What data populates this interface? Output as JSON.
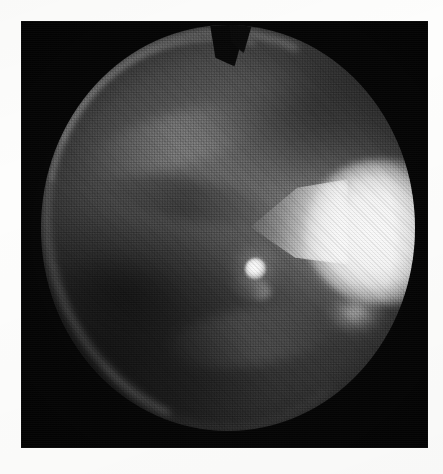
{
  "figure": {
    "kind": "grayscale-photograph",
    "modality": "endoscopic-fundus-photograph",
    "caption": "",
    "alt_text": "Grayscale circular endoscopic photograph on a black plate",
    "page_background": "#fdfdfc",
    "plate": {
      "background_color": "#050505",
      "left": 21,
      "top": 21,
      "width": 407,
      "height": 427
    },
    "field_of_view": {
      "shape": "circle",
      "center_x": 228,
      "center_y": 228,
      "radius_x": 187,
      "radius_y": 203,
      "mean_tone": "#3a3a3a"
    },
    "regions": [
      {
        "name": "bright-flare",
        "label": "saturated specular flare",
        "position": "right-of-center",
        "center_x": 358,
        "center_y": 232,
        "peak_tone": "#fbfbfb"
      },
      {
        "name": "specular-highlight",
        "label": "central specular highlight",
        "position": "center",
        "center_x": 255,
        "center_y": 265,
        "peak_tone": "#ffffff"
      },
      {
        "name": "rim-arc",
        "label": "bright upper-left rim crescent",
        "position": "upper-left-circumference",
        "peak_tone": "#d0d0d0"
      },
      {
        "name": "top-notch",
        "label": "dark notch in upper rim",
        "position": "top-center",
        "center_x": 222,
        "center_y": 36,
        "tone": "#070707"
      },
      {
        "name": "lower-left-shadow",
        "label": "dark lower-left vignette",
        "position": "lower-left",
        "tone": "#101010"
      }
    ],
    "texture": {
      "name": "halftone-screen",
      "label": "printed halftone dot screen",
      "dot_pitch_px": 2.6,
      "screen_angle_deg": 45
    }
  }
}
